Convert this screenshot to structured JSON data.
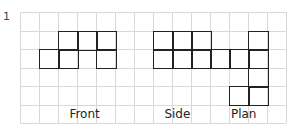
{
  "question_number": "1",
  "grid": {
    "cols": 14,
    "rows": 6,
    "cell_w": 19,
    "cell_h": 18.5,
    "line_color": "#d8d8d8",
    "shape_color": "#222222"
  },
  "views": [
    {
      "name": "front",
      "label": "Front",
      "label_col": 2.6,
      "cells": [
        [
          2,
          1
        ],
        [
          3,
          1
        ],
        [
          4,
          1
        ],
        [
          1,
          2
        ],
        [
          2,
          2
        ],
        [
          4,
          2
        ]
      ]
    },
    {
      "name": "side",
      "label": "Side",
      "label_col": 7.6,
      "cells": [
        [
          7,
          1
        ],
        [
          8,
          1
        ],
        [
          9,
          1
        ],
        [
          7,
          2
        ],
        [
          8,
          2
        ],
        [
          9,
          2
        ]
      ]
    },
    {
      "name": "plan",
      "label": "Plan",
      "label_col": 11.1,
      "cells": [
        [
          12,
          1
        ],
        [
          10,
          2
        ],
        [
          11,
          2
        ],
        [
          12,
          2
        ],
        [
          12,
          3
        ],
        [
          11,
          4
        ],
        [
          12,
          4
        ]
      ]
    }
  ]
}
